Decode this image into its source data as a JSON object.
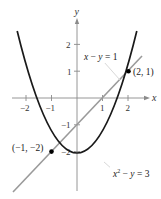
{
  "figure": {
    "axes": {
      "x_label": "x",
      "y_label": "y",
      "x_ticks": [
        {
          "value": -2,
          "label": "−2"
        },
        {
          "value": -1,
          "label": "−1"
        },
        {
          "value": 1,
          "label": "1"
        },
        {
          "value": 2,
          "label": "2"
        }
      ],
      "y_ticks": [
        {
          "value": 2,
          "label": "2"
        },
        {
          "value": 1,
          "label": "1"
        },
        {
          "value": -1,
          "label": "−1"
        },
        {
          "value": -2,
          "label": "−2"
        }
      ]
    },
    "curves": {
      "parabola": {
        "equation": "x² − y = 3",
        "eq_base": "x",
        "eq_sup": "2",
        "eq_rest": " − y = 3",
        "color": "#1a1a1a"
      },
      "line": {
        "equation": "x − y = 1",
        "color": "#9a9a9a"
      }
    },
    "points": [
      {
        "label": "(2, 1)",
        "x": 2,
        "y": 1
      },
      {
        "label": "(−1, −2)",
        "x": -1,
        "y": -2
      }
    ]
  }
}
